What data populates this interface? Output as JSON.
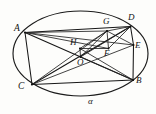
{
  "figure": {
    "kind": "circle-geometry-diagram",
    "region_label": "α",
    "region_label_name": "alpha",
    "stroke_color": "#161616",
    "background_color": "#fdfdfb",
    "canvas": {
      "width": 156,
      "height": 114
    }
  },
  "circle": {
    "cx": 80.5,
    "cy": 53.5,
    "rx": 67.5,
    "ry": 42.5
  },
  "points": [
    {
      "id": "A",
      "label": "A",
      "x": 25.0,
      "y": 32.5,
      "label_x": 14,
      "label_y": 24
    },
    {
      "id": "G",
      "label": "G",
      "x": 107.0,
      "y": 31.0,
      "label_x": 103,
      "label_y": 17
    },
    {
      "id": "D",
      "label": "D",
      "x": 130.5,
      "y": 26.5,
      "label_x": 128,
      "label_y": 13
    },
    {
      "id": "E",
      "label": "E",
      "x": 133.5,
      "y": 45.0,
      "label_x": 135,
      "label_y": 41
    },
    {
      "id": "F",
      "label": "F",
      "x": 108.5,
      "y": 48.5,
      "label_x": 104,
      "label_y": 49
    },
    {
      "id": "H",
      "label": "H",
      "x": 80.0,
      "y": 48.5,
      "label_x": 70,
      "label_y": 38
    },
    {
      "id": "O",
      "label": "O",
      "x": 80.5,
      "y": 57.0,
      "label_x": 77,
      "label_y": 58
    },
    {
      "id": "B",
      "label": "B",
      "x": 133.0,
      "y": 80.0,
      "label_x": 136,
      "label_y": 76
    },
    {
      "id": "C",
      "label": "C",
      "x": 32.0,
      "y": 84.5,
      "label_x": 18,
      "label_y": 82
    }
  ],
  "segments": [
    {
      "name": "segment-A-D",
      "from": "A",
      "to": "D"
    },
    {
      "name": "segment-A-G",
      "from": "A",
      "to": "G"
    },
    {
      "name": "segment-A-F",
      "from": "A",
      "to": "F"
    },
    {
      "name": "segment-A-E",
      "from": "A",
      "to": "E"
    },
    {
      "name": "segment-A-B",
      "from": "A",
      "to": "B"
    },
    {
      "name": "segment-A-C",
      "from": "A",
      "to": "C"
    },
    {
      "name": "segment-C-D",
      "from": "C",
      "to": "D"
    },
    {
      "name": "segment-C-G",
      "from": "C",
      "to": "G"
    },
    {
      "name": "segment-C-E",
      "from": "C",
      "to": "E"
    },
    {
      "name": "segment-C-B",
      "from": "C",
      "to": "B"
    },
    {
      "name": "segment-D-E",
      "from": "D",
      "to": "E"
    },
    {
      "name": "segment-E-B",
      "from": "E",
      "to": "B"
    },
    {
      "name": "segment-G-F",
      "from": "G",
      "to": "F"
    },
    {
      "name": "segment-G-D",
      "from": "G",
      "to": "D"
    },
    {
      "name": "segment-G-E",
      "from": "G",
      "to": "E"
    },
    {
      "name": "segment-D-F",
      "from": "D",
      "to": "F"
    },
    {
      "name": "segment-H-G",
      "from": "H",
      "to": "G"
    },
    {
      "name": "segment-H-F",
      "from": "H",
      "to": "F"
    },
    {
      "name": "segment-H-B",
      "from": "H",
      "to": "B"
    },
    {
      "name": "segment-O-D",
      "from": "O",
      "to": "D"
    },
    {
      "name": "segment-O-G",
      "from": "O",
      "to": "G"
    },
    {
      "name": "segment-O-B",
      "from": "O",
      "to": "B"
    }
  ]
}
